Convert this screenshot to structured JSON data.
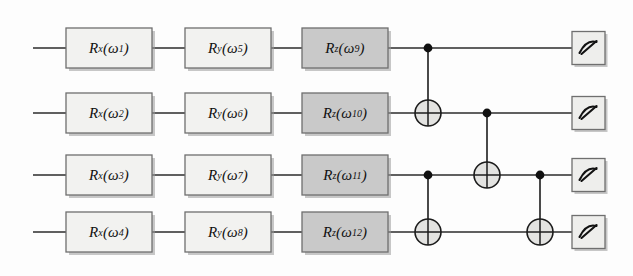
{
  "figure": {
    "kind": "quantum-circuit-diagram",
    "wire_count": 4,
    "background_color": "#fdfdfd",
    "wire_color": "#2b2b2b"
  },
  "colors": {
    "rx_fill": "#f2f2f0",
    "ry_fill": "#f2f2f0",
    "rz_fill": "#c9c9c9",
    "gate_border": "#6f6f6f",
    "measure_fill": "#eeeeec",
    "control_dot": "#111111",
    "target_fill": "#e3e3e1"
  },
  "layout": {
    "wire_y": [
      48,
      113,
      175,
      232
    ],
    "wire_start_x": 33,
    "wire_end_x": 572,
    "columns": {
      "rx_x": 66,
      "ry_x": 185,
      "rz_x": 302,
      "gate_w": 86,
      "gate_h": 40,
      "measure_x": 572,
      "measure_size": 33,
      "cnot_col_1_x": 428,
      "cnot_col_2_x": 487,
      "cnot_col_3_x": 540
    }
  },
  "gates": {
    "rotation_x": [
      {
        "name": "rx-gate-q0",
        "letter": "R",
        "axis": "x",
        "param": "ω",
        "index": "1",
        "wire": 0,
        "fill": "light"
      },
      {
        "name": "rx-gate-q1",
        "letter": "R",
        "axis": "x",
        "param": "ω",
        "index": "2",
        "wire": 1,
        "fill": "light"
      },
      {
        "name": "rx-gate-q2",
        "letter": "R",
        "axis": "x",
        "param": "ω",
        "index": "3",
        "wire": 2,
        "fill": "light"
      },
      {
        "name": "rx-gate-q3",
        "letter": "R",
        "axis": "x",
        "param": "ω",
        "index": "4",
        "wire": 3,
        "fill": "light"
      }
    ],
    "rotation_y": [
      {
        "name": "ry-gate-q0",
        "letter": "R",
        "axis": "y",
        "param": "ω",
        "index": "5",
        "wire": 0,
        "fill": "light"
      },
      {
        "name": "ry-gate-q1",
        "letter": "R",
        "axis": "y",
        "param": "ω",
        "index": "6",
        "wire": 1,
        "fill": "light"
      },
      {
        "name": "ry-gate-q2",
        "letter": "R",
        "axis": "y",
        "param": "ω",
        "index": "7",
        "wire": 2,
        "fill": "light"
      },
      {
        "name": "ry-gate-q3",
        "letter": "R",
        "axis": "y",
        "param": "ω",
        "index": "8",
        "wire": 3,
        "fill": "light"
      }
    ],
    "rotation_z": [
      {
        "name": "rz-gate-q0",
        "letter": "R",
        "axis": "z",
        "param": "ω",
        "index": "9",
        "wire": 0,
        "fill": "dark"
      },
      {
        "name": "rz-gate-q1",
        "letter": "R",
        "axis": "z",
        "param": "ω",
        "index": "10",
        "wire": 1,
        "fill": "dark"
      },
      {
        "name": "rz-gate-q2",
        "letter": "R",
        "axis": "z",
        "param": "ω",
        "index": "11",
        "wire": 2,
        "fill": "dark"
      },
      {
        "name": "rz-gate-q3",
        "letter": "R",
        "axis": "z",
        "param": "ω",
        "index": "12",
        "wire": 3,
        "fill": "dark"
      }
    ],
    "cnots": [
      {
        "name": "cnot-q0-q1",
        "column": 1,
        "control_wire": 0,
        "target_wire": 1,
        "x": 428
      },
      {
        "name": "cnot-q2-q3",
        "column": 1,
        "control_wire": 2,
        "target_wire": 3,
        "x": 428
      },
      {
        "name": "cnot-q1-q2",
        "column": 2,
        "control_wire": 1,
        "target_wire": 2,
        "x": 487
      },
      {
        "name": "cnot-q2-q3-b",
        "column": 3,
        "control_wire": 2,
        "target_wire": 3,
        "x": 540
      }
    ],
    "measurements": [
      {
        "name": "measure-q0",
        "wire": 0,
        "icon": "meter-icon"
      },
      {
        "name": "measure-q1",
        "wire": 1,
        "icon": "meter-icon"
      },
      {
        "name": "measure-q2",
        "wire": 2,
        "icon": "meter-icon"
      },
      {
        "name": "measure-q3",
        "wire": 3,
        "icon": "meter-icon"
      }
    ]
  },
  "labels": {
    "rx_texts": [
      "R x (ω 1)",
      "R x (ω 2)",
      "R x (ω 3)",
      "R x (ω 4)"
    ],
    "ry_texts": [
      "R y (ω 5)",
      "R y (ω 6)",
      "R y (ω 7)",
      "R y (ω 8)"
    ],
    "rz_texts": [
      "R z (ω 9)",
      "R z (ω 10)",
      "R z (ω 11)",
      "R z (ω 12)"
    ]
  }
}
